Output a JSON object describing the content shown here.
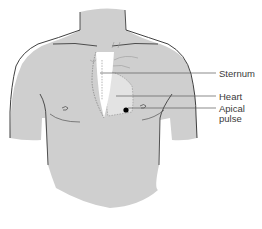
{
  "diagram": {
    "type": "anatomical-illustration",
    "labels": {
      "sternum": "Sternum",
      "heart": "Heart",
      "apical_pulse": "Apical pulse"
    },
    "colors": {
      "skin": "#cfcfcf",
      "skin_outline": "#2b2b2b",
      "sternum": "#ffffff",
      "heart": "#e3e3e3",
      "dashed_outline": "#6a6a6a",
      "leader_line": "#5a5a5a",
      "apical_dot": "#000000",
      "label_text": "#3a3a3a"
    }
  }
}
